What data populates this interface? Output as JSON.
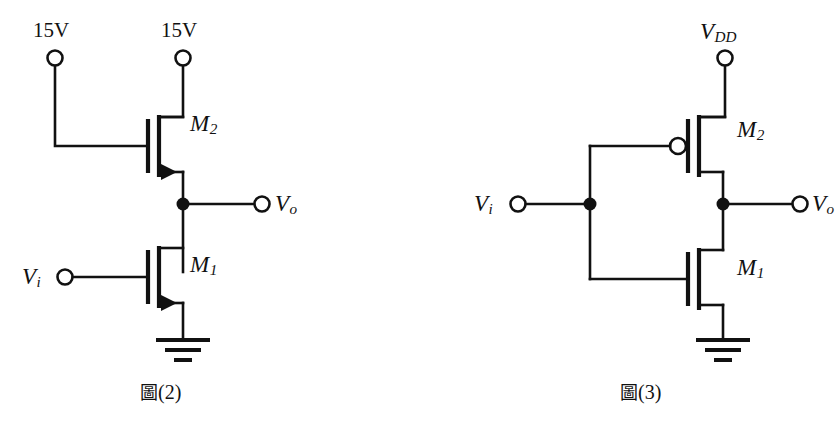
{
  "figure": {
    "background_color": "#ffffff",
    "ink_color": "#111111",
    "width": 838,
    "height": 432
  },
  "circuits": [
    {
      "id": "figure-2",
      "caption_cjk": "圖",
      "caption_number": "(2)",
      "caption_full": "圖(2)",
      "description": "NMOS enhancement-load inverter",
      "terminals": [
        {
          "name": "supply-left",
          "label": "15V",
          "x": 55,
          "y": 58
        },
        {
          "name": "supply-right",
          "label": "15V",
          "x": 183,
          "y": 58
        },
        {
          "name": "input",
          "label": "V",
          "sub": "i",
          "x": 65,
          "y": 277
        },
        {
          "name": "output",
          "label": "V",
          "sub": "o",
          "x": 262,
          "y": 204
        }
      ],
      "devices": [
        {
          "name": "M2",
          "label": "M",
          "sub": "2",
          "type": "nmos",
          "arrow": true,
          "label_x": 190,
          "label_y": 124
        },
        {
          "name": "M1",
          "label": "M",
          "sub": "1",
          "type": "nmos",
          "arrow": true,
          "label_x": 190,
          "label_y": 265
        }
      ],
      "nodes": [
        {
          "name": "output-node",
          "x": 183,
          "y": 204
        }
      ],
      "ground": {
        "name": "ground-symbol",
        "x": 183,
        "y": 340
      }
    },
    {
      "id": "figure-3",
      "caption_cjk": "圖",
      "caption_number": "(3)",
      "caption_full": "圖(3)",
      "description": "CMOS inverter",
      "terminals": [
        {
          "name": "supply",
          "label": "V",
          "sub": "DD",
          "x": 725,
          "y": 58
        },
        {
          "name": "input",
          "label": "V",
          "sub": "i",
          "x": 518,
          "y": 204
        },
        {
          "name": "output",
          "label": "V",
          "sub": "o",
          "x": 800,
          "y": 204
        }
      ],
      "devices": [
        {
          "name": "M2",
          "label": "M",
          "sub": "2",
          "type": "pmos",
          "bubble": true,
          "label_x": 737,
          "label_y": 128
        },
        {
          "name": "M1",
          "label": "M",
          "sub": "1",
          "type": "nmos",
          "bubble": false,
          "label_x": 737,
          "label_y": 268
        }
      ],
      "nodes": [
        {
          "name": "input-node",
          "x": 590,
          "y": 204
        },
        {
          "name": "output-node",
          "x": 723,
          "y": 204
        }
      ],
      "ground": {
        "name": "ground-symbol",
        "x": 723,
        "y": 340
      }
    }
  ],
  "labels": {
    "fig2_supply_left": "15V",
    "fig2_supply_right": "15V",
    "fig2_vi_main": "V",
    "fig2_vi_sub": "i",
    "fig2_vo_main": "V",
    "fig2_vo_sub": "o",
    "fig2_m2_main": "M",
    "fig2_m2_sub": "2",
    "fig2_m1_main": "M",
    "fig2_m1_sub": "1",
    "fig2_caption_cjk": "圖",
    "fig2_caption_num": "(2)",
    "fig3_vdd_main": "V",
    "fig3_vdd_sub": "DD",
    "fig3_vi_main": "V",
    "fig3_vi_sub": "i",
    "fig3_vo_main": "V",
    "fig3_vo_sub": "o",
    "fig3_m2_main": "M",
    "fig3_m2_sub": "2",
    "fig3_m1_main": "M",
    "fig3_m1_sub": "1",
    "fig3_caption_cjk": "圖",
    "fig3_caption_num": "(3)"
  }
}
